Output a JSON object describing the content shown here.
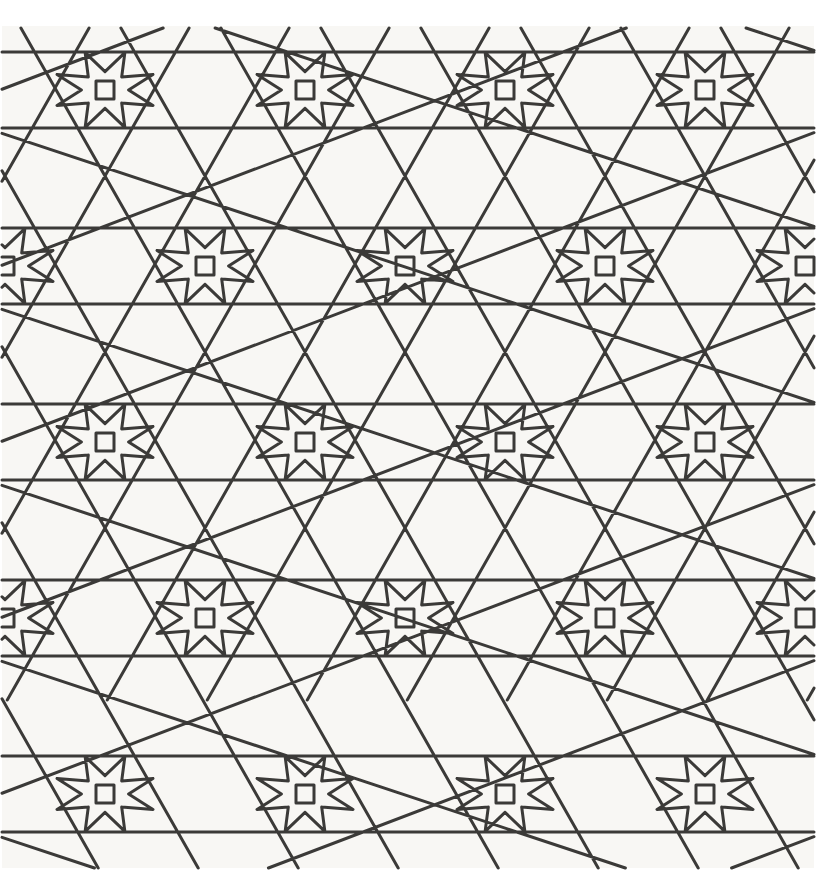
{
  "artwork": {
    "title": "Islamic Geometric Star Pattern",
    "style": "girih eight-pointed star tessellation",
    "medium": "line drawing",
    "canvas": {
      "width": 816,
      "height": 880
    },
    "colors": {
      "line": "#3b3a38",
      "paper": "#f8f7f4",
      "page": "#ffffff"
    },
    "line_width": 3.0,
    "drawing_area": {
      "x": 2,
      "y": 28,
      "width": 812,
      "height": 840
    },
    "lattice": {
      "type": "centered-rectangular",
      "cell_width": 200,
      "cell_height": 352,
      "row_offset_x": 100,
      "row_offset_y": 176,
      "origin_x": 105,
      "origin_y": 90,
      "star_points": 8,
      "star_centers_row_a_x": [
        -95,
        105,
        305,
        505,
        705,
        905
      ],
      "star_centers_row_a_y": [
        90,
        442,
        794
      ],
      "star_centers_row_b_x": [
        5,
        205,
        405,
        605,
        805
      ],
      "star_centers_row_b_y": [
        266,
        618,
        970
      ]
    },
    "motifs": [
      {
        "name": "eight-pointed-star",
        "count": 28,
        "detail": "small square at core"
      },
      {
        "name": "hexagonal-rosette",
        "count": 20
      },
      {
        "name": "elongated-kite",
        "count": 56
      },
      {
        "name": "horizontal-band-line",
        "count": 24
      }
    ]
  },
  "chart_data": {
    "type": "line",
    "title": "Islamic Geometric Star Pattern",
    "xlabel": "",
    "ylabel": "",
    "xlim": [
      0,
      816
    ],
    "ylim": [
      0,
      880
    ],
    "grid": false,
    "legend": "none",
    "series": [
      {
        "name": "pattern-strapwork",
        "description": "Continuous straight-line strapwork forming 8-pointed stars on a centered rectangular lattice of pitch 200 x 352 px"
      }
    ]
  }
}
